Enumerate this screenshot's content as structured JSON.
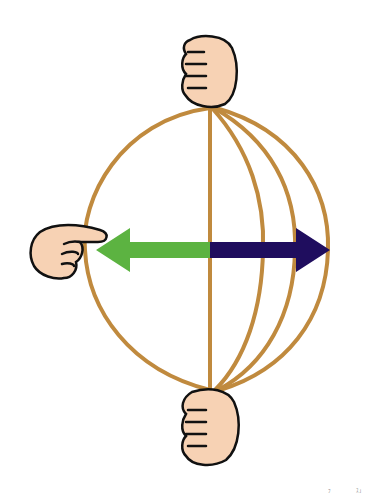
{
  "diagram": {
    "colors": {
      "rope": "#c08a3e",
      "skin": "#f7d2b4",
      "outline": "#111111",
      "arrow_left": "#5cb341",
      "arrow_right": "#1f0d5e",
      "background": "#ffffff"
    },
    "nodes": [
      {
        "id": "top-hand",
        "type": "fist",
        "x": 208,
        "y": 75
      },
      {
        "id": "left-hand",
        "type": "pointing-hand",
        "x": 62,
        "y": 252
      },
      {
        "id": "bottom-hand",
        "type": "fist",
        "x": 208,
        "y": 425
      }
    ],
    "arrows": [
      {
        "id": "left-arrow",
        "direction": "left",
        "color": "#5cb341",
        "from_x": 210,
        "to_x": 96,
        "y": 250
      },
      {
        "id": "right-arrow",
        "direction": "right",
        "color": "#1f0d5e",
        "from_x": 210,
        "to_x": 330,
        "y": 250
      }
    ],
    "rope_strands": [
      {
        "id": "left-arc",
        "equator_x": 85
      },
      {
        "id": "center-line",
        "equator_x": 210
      },
      {
        "id": "strand-1",
        "equator_x": 263
      },
      {
        "id": "strand-2",
        "equator_x": 295
      },
      {
        "id": "strand-3",
        "equator_x": 328
      }
    ],
    "corner_marks": [
      "ﾌ",
      "ｽ｣"
    ]
  }
}
